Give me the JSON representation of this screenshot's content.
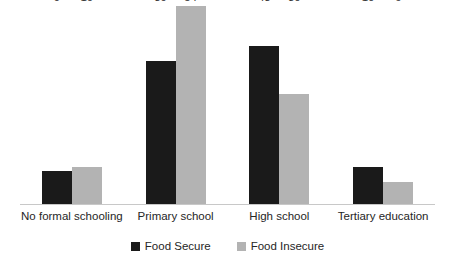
{
  "chart_data": {
    "type": "bar",
    "title": "",
    "subtitle": "",
    "xlabel": "",
    "ylabel": "",
    "grid": false,
    "legend_position": "bottom",
    "ylim": [
      0,
      54
    ],
    "categories": [
      "No formal schooling",
      "Primary school",
      "High school",
      "Tertiary education"
    ],
    "series": [
      {
        "name": "Food Secure",
        "color": "#1a1a1a",
        "values": [
          9,
          39,
          43,
          10
        ]
      },
      {
        "name": "Food Insecure",
        "color": "#b3b3b3",
        "values": [
          10,
          54,
          30,
          6
        ]
      }
    ],
    "value_labels": {
      "no_formal_schooling": {
        "food_secure": "9",
        "food_insecure": "10"
      },
      "primary_school": {
        "food_secure": "39",
        "food_insecure": "54"
      },
      "high_school": {
        "food_secure": "43",
        "food_insecure": "30"
      },
      "tertiary_education": {
        "food_secure": "10",
        "food_insecure": "6"
      }
    }
  },
  "legend": {
    "items": [
      {
        "label": "Food Secure",
        "swatch": "legend-swatch-dark"
      },
      {
        "label": "Food Insecure",
        "swatch": "legend-swatch-gray"
      }
    ]
  },
  "colors": {
    "food_secure": "#1a1a1a",
    "food_insecure": "#b3b3b3",
    "axis_line": "#c8c8c8",
    "text": "#262626",
    "background": "#ffffff"
  }
}
